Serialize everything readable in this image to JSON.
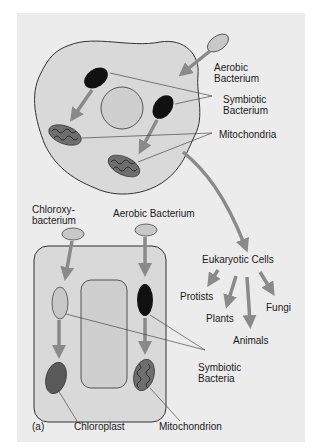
{
  "figure": {
    "panel_label": "(a)",
    "colors": {
      "background": "#ececec",
      "cell_fill": "#d9d9d9",
      "nucleus_fill": "#cfcfcf",
      "arrow": "#8a8a8a",
      "bacterium_light": "#c8c8c8",
      "bacterium_dark": "#111111",
      "mitochondrion": "#6e6e6e",
      "outline": "#333333"
    },
    "animal_cell": {
      "labels": {
        "aerobic_bacterium": "Aerobic\nBacterium",
        "symbiotic_bacterium": "Symbiotic\nBacterium",
        "mitochondria": "Mitochondria"
      }
    },
    "plant_cell": {
      "labels": {
        "chloroxybacterium": "Chloroxy-\nbacterium",
        "aerobic_bacterium": "Aerobic Bacterium",
        "symbiotic_bacteria": "Symbiotic\nBacteria",
        "chloroplast": "Chloroplast",
        "mitochondrion": "Mitochondrion"
      }
    },
    "lineage": {
      "root": "Eukaryotic Cells",
      "branches": [
        "Protists",
        "Plants",
        "Animals",
        "Fungi"
      ]
    }
  }
}
